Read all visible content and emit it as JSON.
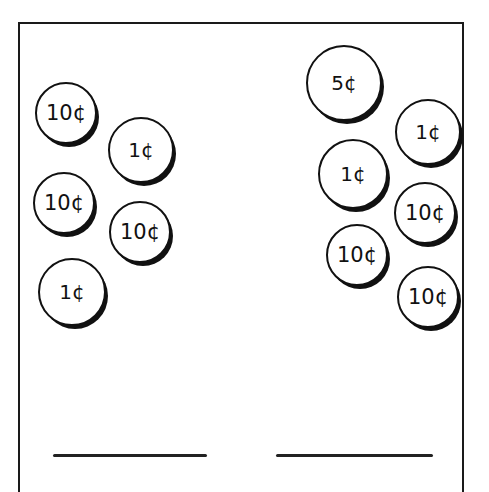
{
  "worksheet": {
    "left_group": {
      "coins": [
        {
          "label": "10¢",
          "value": 10,
          "cx": 66,
          "cy": 113,
          "r": 31
        },
        {
          "label": "1¢",
          "value": 1,
          "cx": 141,
          "cy": 150,
          "r": 33
        },
        {
          "label": "10¢",
          "value": 10,
          "cx": 64,
          "cy": 203,
          "r": 31
        },
        {
          "label": "10¢",
          "value": 10,
          "cx": 140,
          "cy": 232,
          "r": 31
        },
        {
          "label": "1¢",
          "value": 1,
          "cx": 72,
          "cy": 292,
          "r": 34
        }
      ],
      "answer_blank": ""
    },
    "right_group": {
      "coins": [
        {
          "label": "5¢",
          "value": 5,
          "cx": 344,
          "cy": 83,
          "r": 38
        },
        {
          "label": "1¢",
          "value": 1,
          "cx": 428,
          "cy": 132,
          "r": 33
        },
        {
          "label": "1¢",
          "value": 1,
          "cx": 353,
          "cy": 174,
          "r": 35
        },
        {
          "label": "10¢",
          "value": 10,
          "cx": 425,
          "cy": 213,
          "r": 31
        },
        {
          "label": "10¢",
          "value": 10,
          "cx": 357,
          "cy": 255,
          "r": 31
        },
        {
          "label": "10¢",
          "value": 10,
          "cx": 428,
          "cy": 297,
          "r": 31
        }
      ],
      "answer_blank": ""
    }
  }
}
